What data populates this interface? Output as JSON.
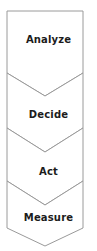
{
  "diagram": {
    "type": "vertical-chevron-process",
    "title": "",
    "orientation": "vertical",
    "canvas": {
      "width": 97,
      "height": 251
    },
    "style": {
      "fill": "#ffffff",
      "stroke": "#9a9a9a",
      "stroke_width": 1,
      "text_color": "#1c1c1c",
      "background": "#ffffff"
    },
    "stages": [
      {
        "label": "Analyze",
        "order": 1,
        "label_y": 40
      },
      {
        "label": "Decide",
        "order": 2,
        "label_y": 115
      },
      {
        "label": "Act",
        "order": 3,
        "label_y": 172
      },
      {
        "label": "Measure",
        "order": 4,
        "label_y": 218
      }
    ],
    "geometry": {
      "left": 7,
      "right": 83,
      "top": 11,
      "bottom": 246,
      "notch_depth": 23,
      "band_tops": [
        11,
        73,
        128,
        181
      ],
      "band_notch_points": [
        96,
        152,
        205,
        246
      ]
    }
  }
}
